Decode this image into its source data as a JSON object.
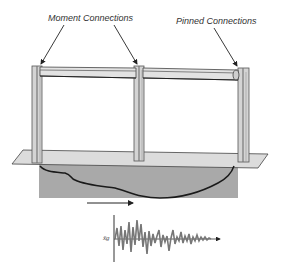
{
  "diagram": {
    "type": "structural frame on ground with earthquake excitation",
    "labels": {
      "moment_connections": "Moment Connections",
      "pinned_connections": "Pinned Connections"
    },
    "ground_motion_symbol": "ẍg",
    "elements": [
      "three columns",
      "two beams",
      "foundation slab",
      "soil block",
      "ground motion arrow",
      "accelerogram"
    ],
    "colors": {
      "steel_light": "#d9d9d9",
      "steel_dark": "#555555",
      "slab": "#dcdcdc",
      "soil": "#a9a9a9",
      "line": "#222222",
      "signal": "#777777"
    }
  }
}
